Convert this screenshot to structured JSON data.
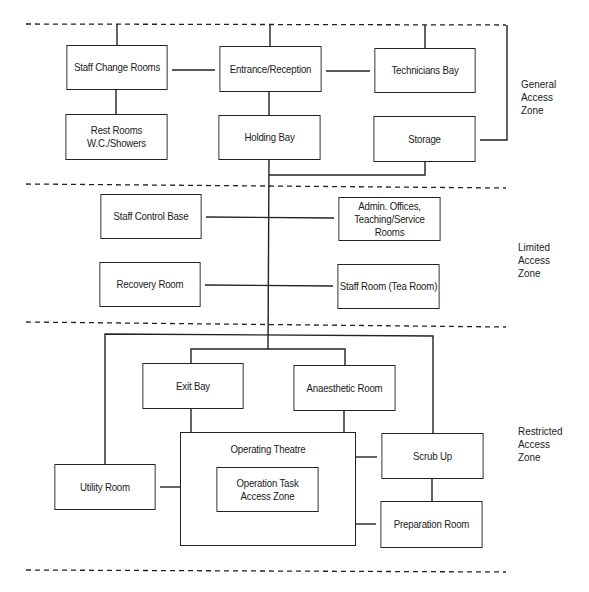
{
  "diagram": {
    "zones": [
      {
        "id": "general",
        "label": "General\nAccess\nZone"
      },
      {
        "id": "limited",
        "label": "Limited\nAccess\nZone"
      },
      {
        "id": "restricted",
        "label": "Restricted\nAccess\nZone"
      }
    ],
    "rooms": {
      "staff_change_rooms": "Staff Change Rooms",
      "entrance_reception": "Entrance/Reception",
      "technicians_bay": "Technicians Bay",
      "rest_rooms": "Rest Rooms\nW.C./Showers",
      "holding_bay": "Holding Bay",
      "storage": "Storage",
      "staff_control_base": "Staff Control Base",
      "admin_offices": "Admin. Offices,\nTeaching/Service Rooms",
      "recovery_room": "Recovery Room",
      "staff_room": "Staff Room (Tea Room)",
      "exit_bay": "Exit Bay",
      "anaesthetic_room": "Anaesthetic Room",
      "operating_theatre": "Operating Theatre",
      "operation_task_zone": "Operation Task\nAccess Zone",
      "scrub_up": "Scrub Up",
      "utility_room": "Utility Room",
      "preparation_room": "Preparation Room"
    },
    "connections": [
      [
        "Staff Change Rooms",
        "Entrance/Reception"
      ],
      [
        "Entrance/Reception",
        "Technicians Bay"
      ],
      [
        "Staff Change Rooms",
        "Rest Rooms W.C./Showers"
      ],
      [
        "Entrance/Reception",
        "Holding Bay"
      ],
      [
        "Storage",
        "Holding Bay"
      ],
      [
        "Holding Bay",
        "Staff Control Base"
      ],
      [
        "Holding Bay",
        "Admin. Offices, Teaching/Service Rooms"
      ],
      [
        "Holding Bay",
        "Recovery Room"
      ],
      [
        "Holding Bay",
        "Staff Room (Tea Room)"
      ],
      [
        "Holding Bay",
        "Exit Bay"
      ],
      [
        "Holding Bay",
        "Anaesthetic Room"
      ],
      [
        "Holding Bay",
        "Utility Room"
      ],
      [
        "Holding Bay",
        "Scrub Up"
      ],
      [
        "Exit Bay",
        "Operating Theatre"
      ],
      [
        "Anaesthetic Room",
        "Operating Theatre"
      ],
      [
        "Operating Theatre",
        "Utility Room"
      ],
      [
        "Operating Theatre",
        "Scrub Up"
      ],
      [
        "Operating Theatre",
        "Preparation Room"
      ],
      [
        "Scrub Up",
        "Preparation Room"
      ]
    ]
  }
}
